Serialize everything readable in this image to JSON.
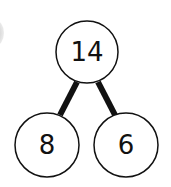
{
  "diagram": {
    "type": "part-whole model",
    "whole": "14",
    "parts": [
      "8",
      "6"
    ],
    "colors": {
      "stroke": "#111111",
      "fill": "#ffffff",
      "text": "#111111"
    }
  }
}
